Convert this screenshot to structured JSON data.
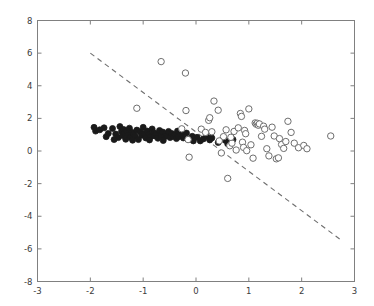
{
  "chart_data": {
    "type": "scatter",
    "title": "",
    "xlabel": "",
    "ylabel": "",
    "xlim": [
      -3,
      3
    ],
    "ylim": [
      -8,
      8
    ],
    "xticks": [
      -3,
      -2,
      -1,
      0,
      1,
      2,
      3
    ],
    "yticks": [
      -8,
      -6,
      -4,
      -2,
      0,
      2,
      4,
      6,
      8
    ],
    "xtick_labels": [
      "-3",
      "-2",
      "-1",
      "0",
      "1",
      "2",
      "3"
    ],
    "ytick_labels": [
      "-8",
      "-6",
      "-4",
      "-2",
      "0",
      "2",
      "4",
      "6",
      "8"
    ],
    "grid": false,
    "legend": null,
    "series": [
      {
        "name": "class-0-filled",
        "marker": "filled-circle",
        "color": "#1a1a1a",
        "edge_color": "#1a1a1a",
        "size": 3.0,
        "points": [
          [
            -1.93,
            1.45
          ],
          [
            -1.9,
            1.22
          ],
          [
            -1.82,
            1.3
          ],
          [
            -1.74,
            1.42
          ],
          [
            -1.7,
            0.88
          ],
          [
            -1.66,
            1.08
          ],
          [
            -1.58,
            1.38
          ],
          [
            -1.52,
            1.04
          ],
          [
            -1.47,
            0.82
          ],
          [
            -1.44,
            1.5
          ],
          [
            -1.41,
            1.2
          ],
          [
            -1.39,
            0.95
          ],
          [
            -1.37,
            1.32
          ],
          [
            -1.35,
            1.1
          ],
          [
            -1.33,
            0.72
          ],
          [
            -1.31,
            1.24
          ],
          [
            -1.28,
            0.98
          ],
          [
            -1.26,
            1.4
          ],
          [
            -1.24,
            0.84
          ],
          [
            -1.21,
            1.14
          ],
          [
            -1.18,
            1.02
          ],
          [
            -1.15,
            0.9
          ],
          [
            -1.12,
            1.28
          ],
          [
            -1.09,
            0.7
          ],
          [
            -1.06,
            1.18
          ],
          [
            -1.03,
            0.96
          ],
          [
            -1.0,
            1.45
          ],
          [
            -0.98,
            1.08
          ],
          [
            -0.95,
            0.8
          ],
          [
            -0.92,
            1.22
          ],
          [
            -0.89,
            1.0
          ],
          [
            -0.86,
            0.88
          ],
          [
            -0.83,
            1.35
          ],
          [
            -0.8,
            1.12
          ],
          [
            -0.78,
            0.92
          ],
          [
            -0.75,
            1.05
          ],
          [
            -0.72,
            0.78
          ],
          [
            -0.69,
            1.26
          ],
          [
            -0.66,
            0.98
          ],
          [
            -0.63,
            1.16
          ],
          [
            -0.6,
            0.86
          ],
          [
            -0.57,
            1.04
          ],
          [
            -0.55,
            0.94
          ],
          [
            -0.52,
            1.2
          ],
          [
            -0.49,
            0.82
          ],
          [
            -0.46,
            1.08
          ],
          [
            -0.43,
            0.9
          ],
          [
            -0.4,
            1.0
          ],
          [
            -0.37,
            0.76
          ],
          [
            -0.33,
            0.88
          ],
          [
            -0.28,
            1.06
          ],
          [
            -0.24,
            0.8
          ],
          [
            -0.18,
            1.1
          ],
          [
            -0.12,
            0.72
          ],
          [
            -0.07,
            0.9
          ],
          [
            0.02,
            0.84
          ],
          [
            0.08,
            0.62
          ],
          [
            0.14,
            0.74
          ],
          [
            0.2,
            0.92
          ],
          [
            0.26,
            0.68
          ],
          [
            0.3,
            0.8
          ],
          [
            0.42,
            0.52
          ],
          [
            0.55,
            0.66
          ],
          [
            0.6,
            0.44
          ],
          [
            0.63,
            0.58
          ],
          [
            0.7,
            0.7
          ],
          [
            -1.55,
            0.7
          ],
          [
            -1.2,
            0.66
          ],
          [
            -0.88,
            0.68
          ],
          [
            -0.62,
            0.64
          ],
          [
            -0.35,
            1.22
          ],
          [
            -0.05,
            0.62
          ]
        ]
      },
      {
        "name": "class-1-open",
        "marker": "open-circle",
        "color": "#ffffff",
        "edge_color": "#6e6e6e",
        "size": 3.2,
        "points": [
          [
            -1.12,
            2.62
          ],
          [
            -0.66,
            5.48
          ],
          [
            -0.2,
            4.78
          ],
          [
            -0.19,
            2.48
          ],
          [
            -0.27,
            1.36
          ],
          [
            -0.15,
            0.7
          ],
          [
            -0.13,
            -0.38
          ],
          [
            0.1,
            1.34
          ],
          [
            0.18,
            1.14
          ],
          [
            0.24,
            1.88
          ],
          [
            0.26,
            2.04
          ],
          [
            0.34,
            3.06
          ],
          [
            0.42,
            2.5
          ],
          [
            0.48,
            -0.12
          ],
          [
            0.52,
            0.88
          ],
          [
            0.57,
            1.3
          ],
          [
            0.6,
            -1.68
          ],
          [
            0.64,
            0.32
          ],
          [
            0.68,
            0.48
          ],
          [
            0.72,
            1.2
          ],
          [
            0.76,
            0.06
          ],
          [
            0.8,
            1.42
          ],
          [
            0.84,
            2.3
          ],
          [
            0.86,
            2.12
          ],
          [
            0.88,
            0.54
          ],
          [
            0.9,
            0.22
          ],
          [
            0.92,
            1.26
          ],
          [
            0.96,
            0.02
          ],
          [
            1.0,
            2.58
          ],
          [
            1.04,
            0.38
          ],
          [
            1.08,
            -0.44
          ],
          [
            1.12,
            1.72
          ],
          [
            1.14,
            1.64
          ],
          [
            1.16,
            1.7
          ],
          [
            1.18,
            1.58
          ],
          [
            1.2,
            1.66
          ],
          [
            1.24,
            0.9
          ],
          [
            1.28,
            1.52
          ],
          [
            1.34,
            0.14
          ],
          [
            1.38,
            -0.3
          ],
          [
            1.44,
            1.46
          ],
          [
            1.48,
            0.92
          ],
          [
            1.52,
            -0.48
          ],
          [
            1.56,
            -0.42
          ],
          [
            1.62,
            0.4
          ],
          [
            1.66,
            0.16
          ],
          [
            1.74,
            1.82
          ],
          [
            1.8,
            1.14
          ],
          [
            1.86,
            0.48
          ],
          [
            1.94,
            0.2
          ],
          [
            2.04,
            0.34
          ],
          [
            2.1,
            0.14
          ],
          [
            2.55,
            0.92
          ],
          [
            0.3,
            1.18
          ],
          [
            0.44,
            0.62
          ],
          [
            0.66,
            0.84
          ],
          [
            0.94,
            1.06
          ],
          [
            1.3,
            1.34
          ],
          [
            1.58,
            0.76
          ],
          [
            1.7,
            0.58
          ]
        ]
      }
    ],
    "lines": [
      {
        "name": "decision-boundary",
        "style": "dashed",
        "color": "#6e6e6e",
        "width": 1.1,
        "x_start": -2.0,
        "y_start": 6.0,
        "x_end": 2.72,
        "y_end": -5.4
      }
    ]
  },
  "axes": {
    "frame_color": "#808080",
    "tick_color": "#808080",
    "background": "#ffffff"
  }
}
